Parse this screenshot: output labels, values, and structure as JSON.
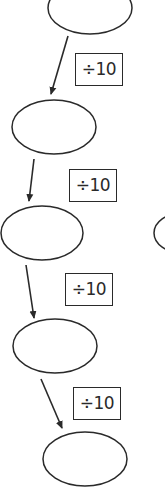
{
  "diagram": {
    "type": "division chain",
    "colors": {
      "stroke": "#2a2a2a",
      "background": "#ffffff"
    },
    "nodes": [
      {
        "id": "node-1",
        "value": "",
        "cx": 90,
        "cy": 8,
        "rx": 42,
        "ry": 26
      },
      {
        "id": "node-2",
        "value": "",
        "cx": 54,
        "cy": 127,
        "rx": 42,
        "ry": 27
      },
      {
        "id": "node-3",
        "value": "",
        "cx": 42,
        "cy": 233,
        "rx": 41,
        "ry": 27
      },
      {
        "id": "node-4",
        "value": "",
        "cx": 55,
        "cy": 346,
        "rx": 42,
        "ry": 27
      },
      {
        "id": "node-5",
        "value": "",
        "cx": 85,
        "cy": 459,
        "rx": 42,
        "ry": 27
      },
      {
        "id": "node-side",
        "value": "",
        "cx": 182,
        "cy": 233,
        "rx": 28,
        "ry": 20
      }
    ],
    "operations": [
      {
        "label": "÷10",
        "x": 75,
        "y": 53
      },
      {
        "label": "÷10",
        "x": 69,
        "y": 169
      },
      {
        "label": "÷10",
        "x": 65,
        "y": 273
      },
      {
        "label": "÷10",
        "x": 73,
        "y": 387
      }
    ],
    "arrows": [
      {
        "x1": 68,
        "y1": 36,
        "x2": 51,
        "y2": 94
      },
      {
        "x1": 34,
        "y1": 159,
        "x2": 29,
        "y2": 201
      },
      {
        "x1": 26,
        "y1": 265,
        "x2": 34,
        "y2": 318
      },
      {
        "x1": 41,
        "y1": 379,
        "x2": 62,
        "y2": 428
      }
    ]
  }
}
